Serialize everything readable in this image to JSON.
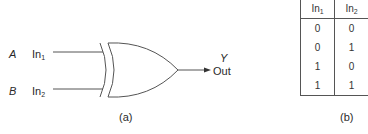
{
  "diagram": {
    "gate_type": "XOR",
    "inputs": [
      {
        "signal": "A",
        "port": "In",
        "port_sub": "1"
      },
      {
        "signal": "B",
        "port": "In",
        "port_sub": "2"
      }
    ],
    "output": {
      "signal": "Y",
      "port": "Out"
    },
    "caption": "(a)",
    "colors": {
      "line": "#555555",
      "text": "#2a2a2a"
    }
  },
  "truth_table": {
    "headers": [
      {
        "text": "In",
        "sub": "1"
      },
      {
        "text": "In",
        "sub": "2"
      }
    ],
    "rows": [
      [
        "0",
        "0"
      ],
      [
        "0",
        "1"
      ],
      [
        "1",
        "0"
      ],
      [
        "1",
        "1"
      ]
    ],
    "caption": "(b)"
  }
}
